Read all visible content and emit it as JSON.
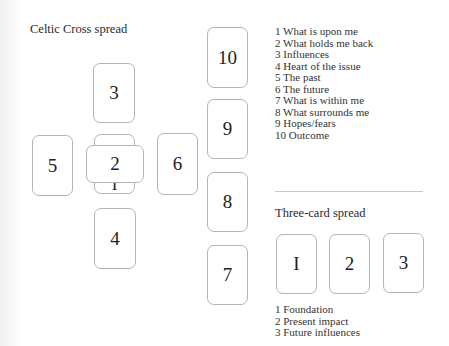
{
  "celtic_cross": {
    "title": "Celtic Cross spread",
    "cards": {
      "c1": "I",
      "c2": "2",
      "c3": "3",
      "c4": "4",
      "c5": "5",
      "c6": "6",
      "c7": "7",
      "c8": "8",
      "c9": "9",
      "c10": "10"
    },
    "legend": [
      "1 What is upon me",
      "2 What holds me back",
      "3 Influences",
      "4 Heart of the issue",
      "5 The past",
      "6 The future",
      "7 What is within me",
      "8 What surrounds me",
      "9 Hopes/fears",
      "10 Outcome"
    ]
  },
  "three_card": {
    "title": "Three-card spread",
    "cards": [
      "I",
      "2",
      "3"
    ],
    "legend": [
      "1 Foundation",
      "2 Present impact",
      "3 Future influences"
    ]
  }
}
